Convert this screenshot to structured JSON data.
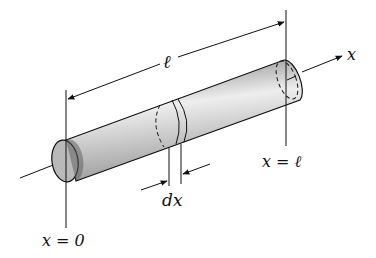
{
  "diagram": {
    "labels": {
      "length": "ℓ",
      "axis": "x",
      "left_end": "x = 0",
      "right_end": "x = ℓ",
      "slice_width": "dx"
    },
    "colors": {
      "line": "#111111",
      "rod_light": "#f0f0f0",
      "rod_dark": "#6a6a6a",
      "background": "#ffffff"
    }
  }
}
